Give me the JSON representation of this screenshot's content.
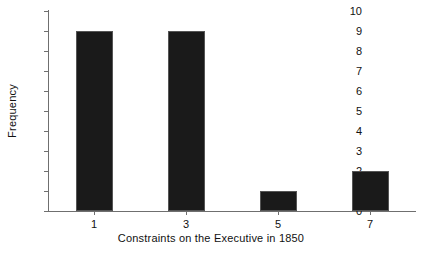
{
  "chart_data": {
    "type": "bar",
    "title": "",
    "xlabel": "Constraints on the Executive in 1850",
    "ylabel": "Frequency",
    "categories": [
      "1",
      "3",
      "5",
      "7"
    ],
    "values": [
      9,
      9,
      1,
      2
    ],
    "xtick_labels": [
      "1",
      "3",
      "5",
      "7"
    ],
    "ytick_labels": [
      "0",
      "1",
      "2",
      "3",
      "4",
      "5",
      "6",
      "7",
      "8",
      "9",
      "10"
    ],
    "ylim": [
      0,
      10
    ],
    "grid": false,
    "legend": false,
    "bar_color": "#1a1a1a",
    "bar_edge_color": "#555555",
    "axis_color": "#6f6f6f",
    "background_color": "#ffffff"
  }
}
